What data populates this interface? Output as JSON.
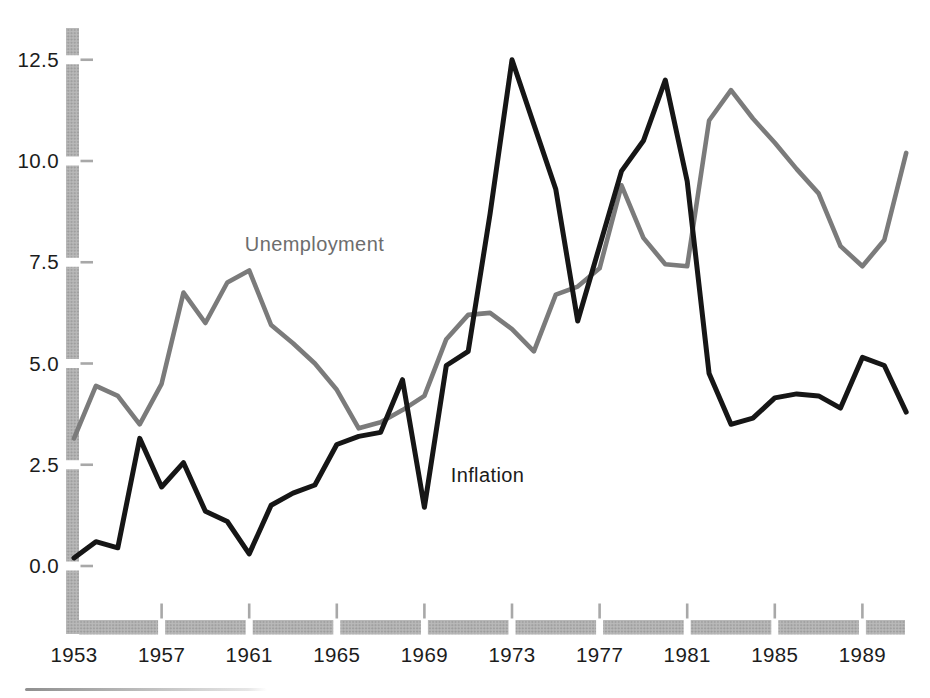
{
  "figure": {
    "background_color": "#ffffff",
    "axis_bar_color": "#b9b9b9",
    "axis_dot_color": "#9b9b9b",
    "tick_dash_color": "#a8a8a8"
  },
  "chart_data": {
    "type": "line",
    "title": "",
    "xlabel": "",
    "ylabel": "",
    "grid": false,
    "legend_position": "inline-annotations",
    "xlim": [
      1953,
      1991
    ],
    "ylim": [
      0,
      12.5
    ],
    "x": [
      1953,
      1954,
      1955,
      1956,
      1957,
      1958,
      1959,
      1960,
      1961,
      1962,
      1963,
      1964,
      1965,
      1966,
      1967,
      1968,
      1969,
      1970,
      1971,
      1972,
      1973,
      1974,
      1975,
      1976,
      1977,
      1978,
      1979,
      1980,
      1981,
      1982,
      1983,
      1984,
      1985,
      1986,
      1987,
      1988,
      1989,
      1990,
      1991
    ],
    "x_ticks": [
      {
        "label": "1953",
        "value": 1953
      },
      {
        "label": "1957",
        "value": 1957
      },
      {
        "label": "1961",
        "value": 1961
      },
      {
        "label": "1965",
        "value": 1965
      },
      {
        "label": "1969",
        "value": 1969
      },
      {
        "label": "1973",
        "value": 1973
      },
      {
        "label": "1977",
        "value": 1977
      },
      {
        "label": "1981",
        "value": 1981
      },
      {
        "label": "1985",
        "value": 1985
      },
      {
        "label": "1989",
        "value": 1989
      }
    ],
    "y_ticks": [
      {
        "label": "0.0",
        "value": 0
      },
      {
        "label": "2.5",
        "value": 2.5
      },
      {
        "label": "5.0",
        "value": 5
      },
      {
        "label": "7.5",
        "value": 7.5
      },
      {
        "label": "10.0",
        "value": 10
      },
      {
        "label": "12.5",
        "value": 12.5
      }
    ],
    "series": [
      {
        "name": "Unemployment",
        "color": "#7b7b7b",
        "line_width": 4.6,
        "values": [
          3.15,
          4.45,
          4.2,
          3.5,
          4.5,
          6.75,
          6.0,
          7.0,
          7.3,
          5.95,
          5.5,
          5.0,
          4.35,
          3.4,
          3.55,
          3.85,
          4.2,
          5.6,
          6.2,
          6.25,
          5.85,
          5.3,
          6.7,
          6.9,
          7.35,
          9.4,
          8.1,
          7.45,
          7.4,
          11.0,
          11.75,
          11.05,
          10.45,
          9.8,
          9.2,
          7.9,
          7.4,
          8.05,
          10.2
        ]
      },
      {
        "name": "Inflation",
        "color": "#161616",
        "line_width": 5.0,
        "values": [
          0.2,
          0.6,
          0.45,
          3.15,
          1.95,
          2.55,
          1.35,
          1.1,
          0.3,
          1.5,
          1.8,
          2.0,
          3.0,
          3.2,
          3.3,
          4.6,
          1.45,
          4.95,
          5.3,
          8.7,
          12.5,
          10.9,
          9.3,
          6.05,
          7.9,
          9.75,
          10.5,
          12.0,
          9.5,
          4.75,
          3.5,
          3.65,
          4.15,
          4.25,
          4.2,
          3.9,
          5.15,
          4.95,
          3.8
        ]
      }
    ],
    "annotations": {
      "unemployment": {
        "text": "Unemployment",
        "x_year": 1960.8,
        "y_value": 8.2
      },
      "inflation": {
        "text": "Inflation",
        "x_year": 1970.2,
        "y_value": 2.49
      }
    }
  }
}
